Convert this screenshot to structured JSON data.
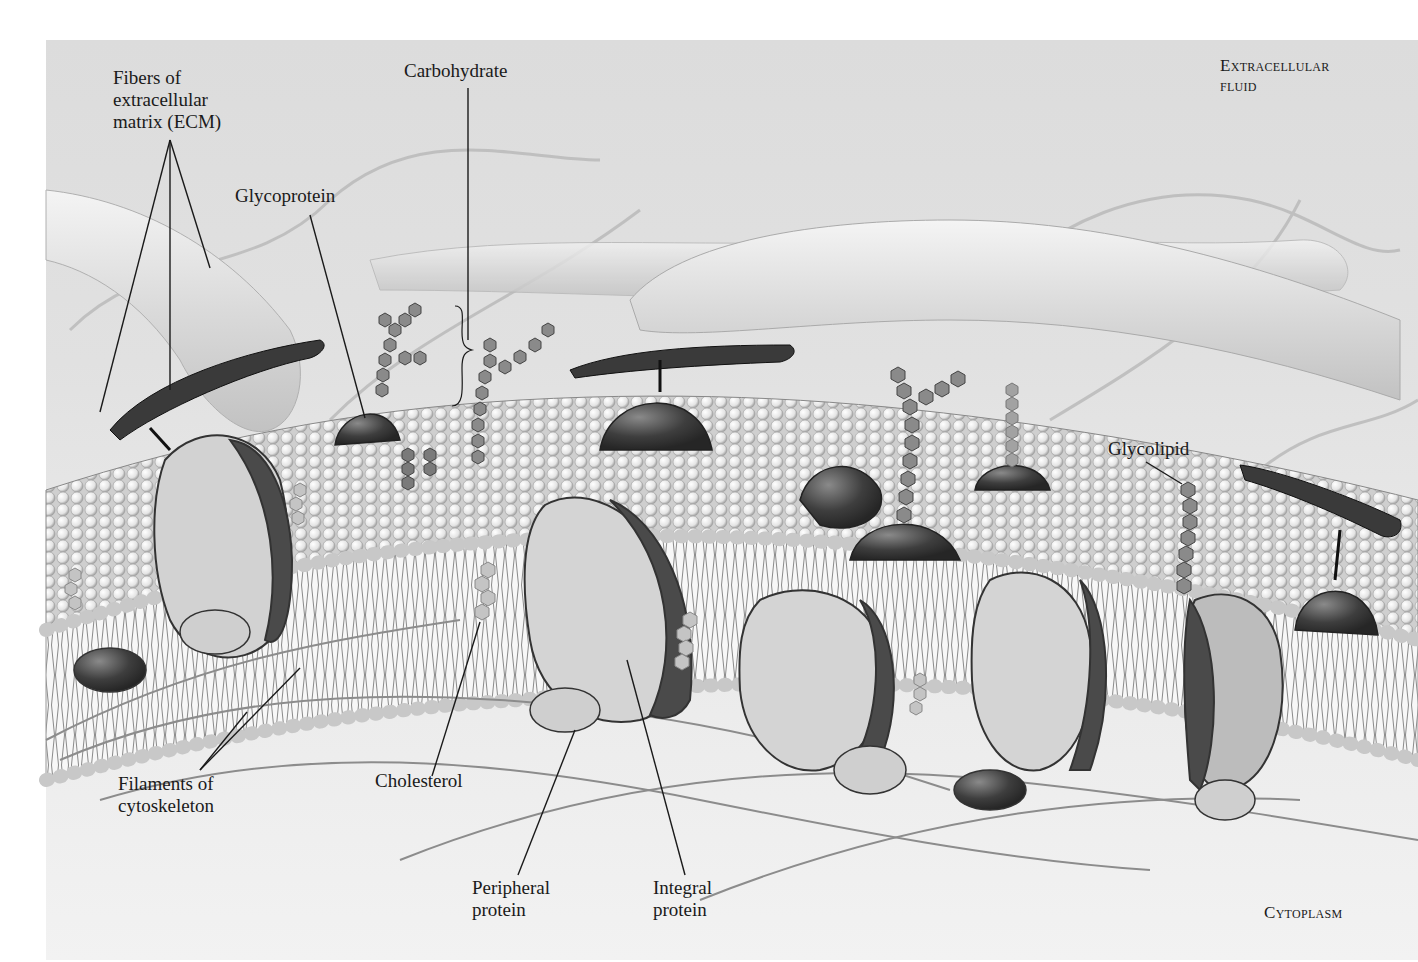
{
  "figure": {
    "regions": {
      "top": "Extracellular\nfluid",
      "bottom": "Cytoplasm"
    },
    "labels": {
      "ecm_fibers": "Fibers of\nextracellular\nmatrix (ECM)",
      "carbohydrate": "Carbohydrate",
      "glycoprotein": "Glycoprotein",
      "glycolipid": "Glycolipid",
      "filaments": "Filaments of\ncytoskeleton",
      "cholesterol": "Cholesterol",
      "peripheral_protein": "Peripheral\nprotein",
      "integral_protein": "Integral\nprotein"
    },
    "colors": {
      "background": "#e2e2e2",
      "protein_dark": "#3c3c3c",
      "protein_light": "#d4d4d4",
      "phospholipid_head": "#f0f0f0",
      "carbohydrate": "#7a7a7a",
      "leader_line": "#1a1a1a"
    }
  }
}
